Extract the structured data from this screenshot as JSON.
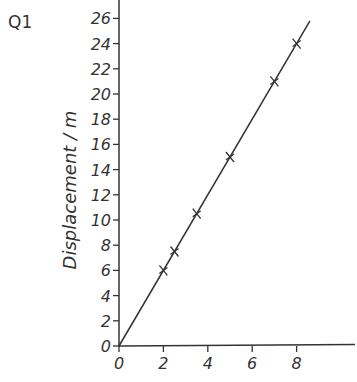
{
  "question_label": "Q1",
  "chart_data": {
    "type": "line",
    "title": "",
    "xlabel": "",
    "ylabel": "Displacement / m",
    "xlim": [
      0,
      10
    ],
    "ylim": [
      0,
      27
    ],
    "x_ticks": [
      0,
      2,
      4,
      6,
      8
    ],
    "y_ticks": [
      0,
      2,
      4,
      6,
      8,
      10,
      12,
      14,
      16,
      18,
      20,
      22,
      24,
      26
    ],
    "grid": false,
    "legend": null,
    "series": [
      {
        "name": "measured points",
        "marker": "cross",
        "x": [
          2,
          2.5,
          3.5,
          5,
          7,
          8
        ],
        "y": [
          6,
          7.5,
          10.5,
          15,
          21,
          24
        ]
      },
      {
        "name": "best-fit line",
        "style": "line",
        "x": [
          0,
          8.6
        ],
        "y": [
          0,
          25.8
        ]
      }
    ],
    "colors": {
      "ink": "#333333",
      "background": "#ffffff"
    }
  }
}
